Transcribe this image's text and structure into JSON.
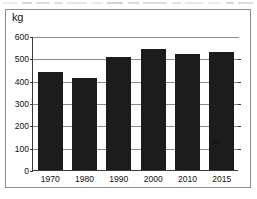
{
  "figure": {
    "unit_label": "kg",
    "x_axis_unit": "年"
  },
  "chart_data": {
    "type": "bar",
    "title": "",
    "xlabel": "年",
    "ylabel": "kg",
    "categories": [
      "1970",
      "1980",
      "1990",
      "2000",
      "2010",
      "2015"
    ],
    "values": [
      440,
      410,
      505,
      540,
      520,
      530
    ],
    "ylim": [
      0,
      600
    ],
    "yticks": [
      0,
      100,
      200,
      300,
      400,
      500,
      600
    ],
    "ytick_labels": [
      "0",
      "100",
      "200",
      "300",
      "400",
      "500",
      "600"
    ],
    "grid": true,
    "legend": null,
    "bar_color": "#1c1c1c",
    "grid_color": "#8a8a8a",
    "axis_color": "#3a3a3a"
  }
}
